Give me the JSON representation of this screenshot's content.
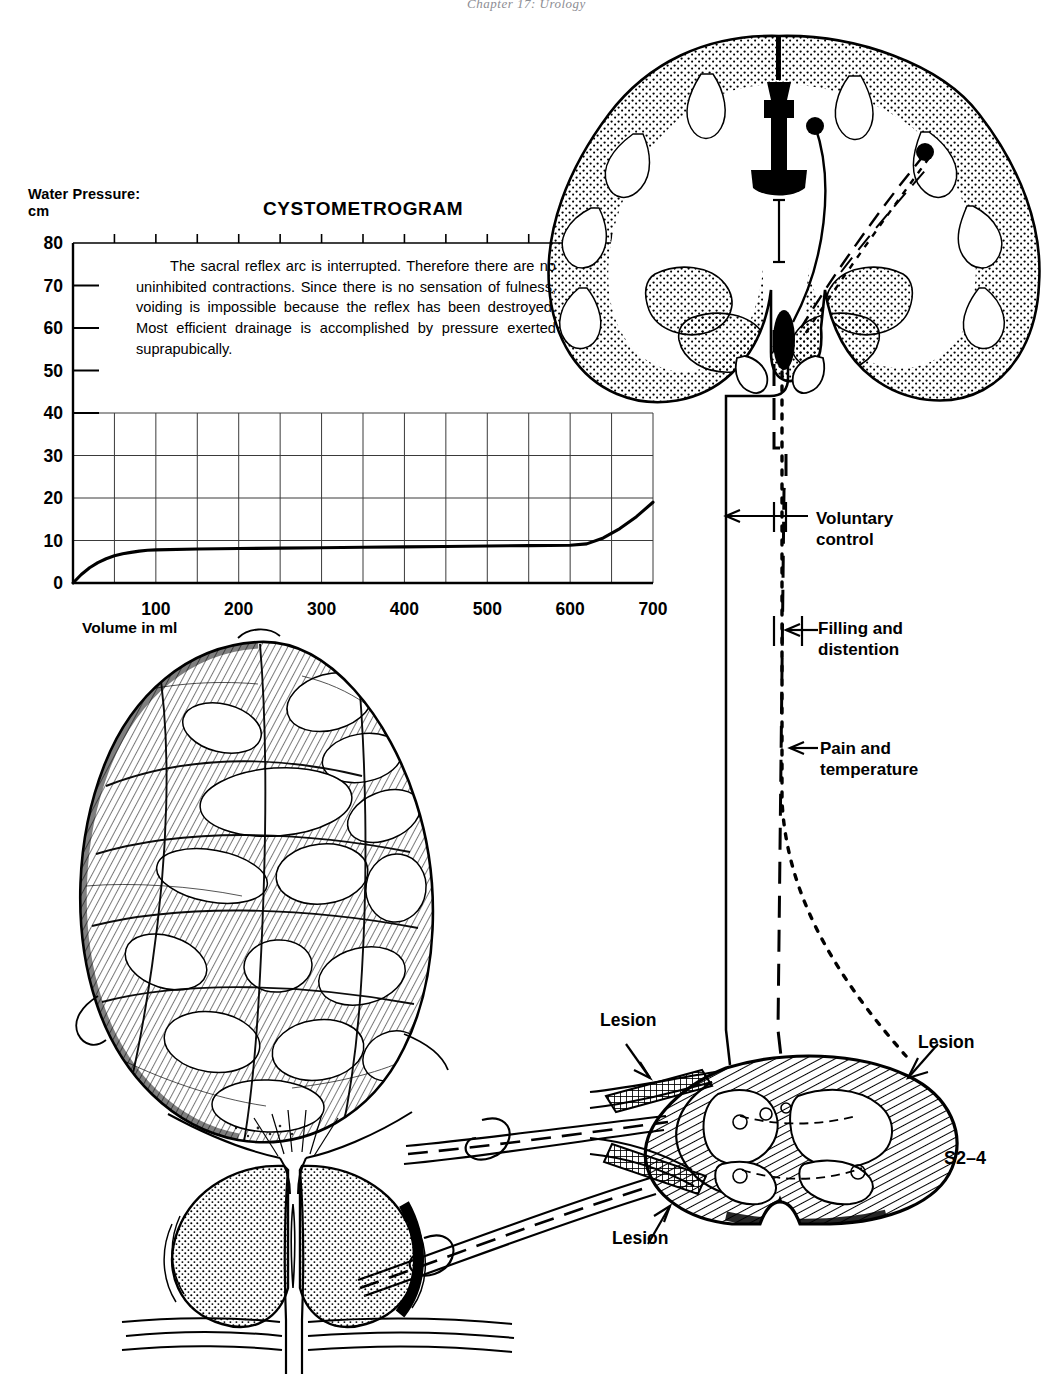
{
  "running_head": "Chapter 17: Urology",
  "chart": {
    "axis_title_line1": "Water Pressure:",
    "axis_title_line2": "cm",
    "title": "CYSTOMETROGRAM",
    "xlabel": "Volume in ml",
    "note": "The sacral reflex arc is interrupted. Therefore there are no uninhibited contractions. Since there is no sensation of fulness, voiding is impossible because the reflex has been destroyed. Most efficient drainage is accomplished by pressure exerted suprapubically."
  },
  "chart_data": {
    "type": "line",
    "title": "CYSTOMETROGRAM",
    "xlabel": "Volume in ml",
    "ylabel": "Water Pressure: cm",
    "xlim": [
      0,
      700
    ],
    "ylim": [
      0,
      80
    ],
    "xticks": [
      0,
      100,
      200,
      300,
      400,
      500,
      600,
      700
    ],
    "xtick_labels": [
      "",
      "100",
      "200",
      "300",
      "400",
      "500",
      "600",
      "700"
    ],
    "yticks": [
      0,
      10,
      20,
      30,
      40,
      50,
      60,
      70,
      80
    ],
    "ytick_labels": [
      "0",
      "10",
      "20",
      "30",
      "40",
      "50",
      "60",
      "70",
      "80"
    ],
    "grid": "minor gridlines every 50 ml on x, every 10 cm on y below 40",
    "grid_x_step": 50,
    "grid_y_step": 10,
    "grid_y_max": 40,
    "legend": "none",
    "series": [
      {
        "name": "Bladder pressure",
        "x": [
          0,
          10,
          20,
          30,
          40,
          50,
          60,
          70,
          80,
          90,
          100,
          150,
          200,
          250,
          300,
          350,
          400,
          450,
          500,
          550,
          600,
          620,
          640,
          660,
          680,
          700
        ],
        "y": [
          0,
          2.0,
          3.6,
          4.8,
          5.7,
          6.4,
          6.9,
          7.2,
          7.5,
          7.7,
          7.8,
          8.0,
          8.1,
          8.2,
          8.3,
          8.4,
          8.5,
          8.6,
          8.7,
          8.8,
          8.9,
          9.2,
          10.6,
          12.8,
          15.6,
          19.0
        ]
      }
    ]
  },
  "tract_labels": {
    "voluntary_line1": "Voluntary",
    "voluntary_line2": "control",
    "filling_line1": "Filling and",
    "filling_line2": "distention",
    "pain_line1": "Pain and",
    "pain_line2": "temperature"
  },
  "cord_labels": {
    "lesion_top_left": "Lesion",
    "lesion_bottom": "Lesion",
    "lesion_right": "Lesion",
    "segment": "S2–4"
  },
  "colors": {
    "ink": "#000000",
    "grid": "#2b2b2b",
    "head": "#8d8d93",
    "paper": "#ffffff"
  }
}
